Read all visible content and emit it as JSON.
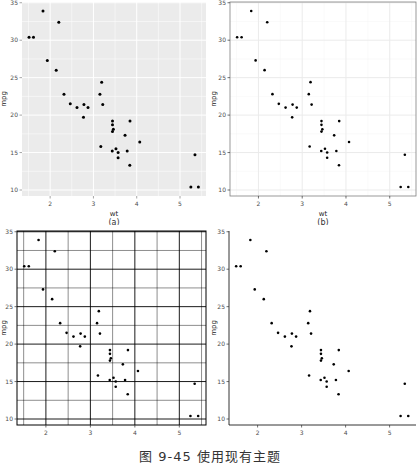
{
  "figure_caption": "图 9-45  使用现有主题",
  "panels": [
    {
      "id": "a",
      "label": "(a)",
      "theme": "grey",
      "xlabel": "wt",
      "ylabel": "mpg"
    },
    {
      "id": "b",
      "label": "(b)",
      "theme": "bw",
      "xlabel": "wt",
      "ylabel": "mpg"
    },
    {
      "id": "c",
      "label": "(c)",
      "theme": "linedraw",
      "xlabel": "wt",
      "ylabel": "mpg"
    },
    {
      "id": "d",
      "label": "(d)",
      "theme": "classic",
      "xlabel": "wt",
      "ylabel": "mpg"
    }
  ],
  "colors": {
    "grey_panel_bg": "#ebebeb",
    "grey_grid": "#ffffff",
    "bw_grid": "#ebebeb",
    "bw_border": "#7f7f7f",
    "linedraw_grid": "#000000",
    "point": "#000000",
    "axis_text": "#4d4d4d"
  },
  "chart_data": [
    {
      "type": "scatter",
      "title": "(a)",
      "xlabel": "wt",
      "ylabel": "mpg",
      "xticks": [
        2,
        3,
        4,
        5
      ],
      "yticks": [
        10,
        15,
        20,
        25,
        30,
        35
      ],
      "xlim": [
        1.35,
        5.6
      ],
      "ylim": [
        9.2,
        35.1
      ],
      "grid": true,
      "x": [
        2.62,
        2.875,
        2.32,
        3.215,
        3.44,
        3.46,
        3.57,
        3.19,
        3.15,
        3.44,
        3.44,
        4.07,
        3.73,
        3.78,
        5.25,
        5.424,
        5.345,
        2.2,
        1.615,
        1.835,
        2.465,
        3.52,
        3.435,
        3.84,
        3.845,
        1.935,
        2.14,
        1.513,
        3.17,
        2.77,
        3.57,
        2.78
      ],
      "y": [
        21.0,
        21.0,
        22.8,
        21.4,
        18.7,
        18.1,
        14.3,
        24.4,
        22.8,
        19.2,
        17.8,
        16.4,
        17.3,
        15.2,
        10.4,
        10.4,
        14.7,
        32.4,
        30.4,
        33.9,
        21.5,
        15.5,
        15.2,
        13.3,
        19.2,
        27.3,
        26.0,
        30.4,
        15.8,
        19.7,
        15.0,
        21.4
      ]
    },
    {
      "type": "scatter",
      "title": "(b)",
      "xlabel": "wt",
      "ylabel": "mpg",
      "xticks": [
        2,
        3,
        4,
        5
      ],
      "yticks": [
        10,
        15,
        20,
        25,
        30,
        35
      ],
      "xlim": [
        1.35,
        5.6
      ],
      "ylim": [
        9.2,
        35.1
      ],
      "grid": true
    },
    {
      "type": "scatter",
      "title": "(c)",
      "xlabel": "wt",
      "ylabel": "mpg",
      "xticks": [
        2,
        3,
        4,
        5
      ],
      "yticks": [
        10,
        15,
        20,
        25,
        30,
        35
      ],
      "xlim": [
        1.35,
        5.6
      ],
      "ylim": [
        9.2,
        35.1
      ],
      "grid": true
    },
    {
      "type": "scatter",
      "title": "(d)",
      "xlabel": "wt",
      "ylabel": "mpg",
      "xticks": [
        2,
        3,
        4,
        5
      ],
      "yticks": [
        10,
        15,
        20,
        25,
        30,
        35
      ],
      "xlim": [
        1.35,
        5.6
      ],
      "ylim": [
        9.2,
        35.1
      ],
      "grid": false
    }
  ]
}
